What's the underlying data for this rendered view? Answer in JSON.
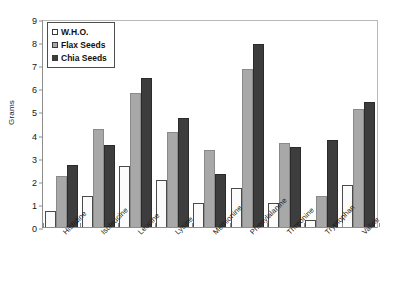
{
  "chart_data": {
    "type": "bar",
    "title": "",
    "xlabel": "",
    "ylabel": "Grams",
    "ylim": [
      0,
      9
    ],
    "yticks": [
      0,
      1,
      2,
      3,
      4,
      5,
      6,
      7,
      8,
      9
    ],
    "grid": false,
    "legend_position": "top-left",
    "categories": [
      "Histidine",
      "Isoleucine",
      "Leucine",
      "Lysine",
      "Methionine",
      "Phenylalanine",
      "Threonine",
      "Tryptophan",
      "Valine"
    ],
    "series": [
      {
        "name": "W.H.O.",
        "color": "#ffffff",
        "values": [
          0.7,
          1.35,
          2.65,
          2.05,
          1.05,
          1.7,
          1.05,
          0.3,
          1.8
        ]
      },
      {
        "name": "Flax Seeds",
        "color": "#a8a8a8",
        "values": [
          2.2,
          4.25,
          5.8,
          4.1,
          3.35,
          6.85,
          3.65,
          1.35,
          5.1
        ]
      },
      {
        "name": "Chia Seeds",
        "color": "#3d3d3d",
        "values": [
          2.7,
          3.55,
          6.45,
          4.7,
          2.3,
          7.9,
          3.45,
          3.75,
          5.4
        ]
      }
    ]
  }
}
